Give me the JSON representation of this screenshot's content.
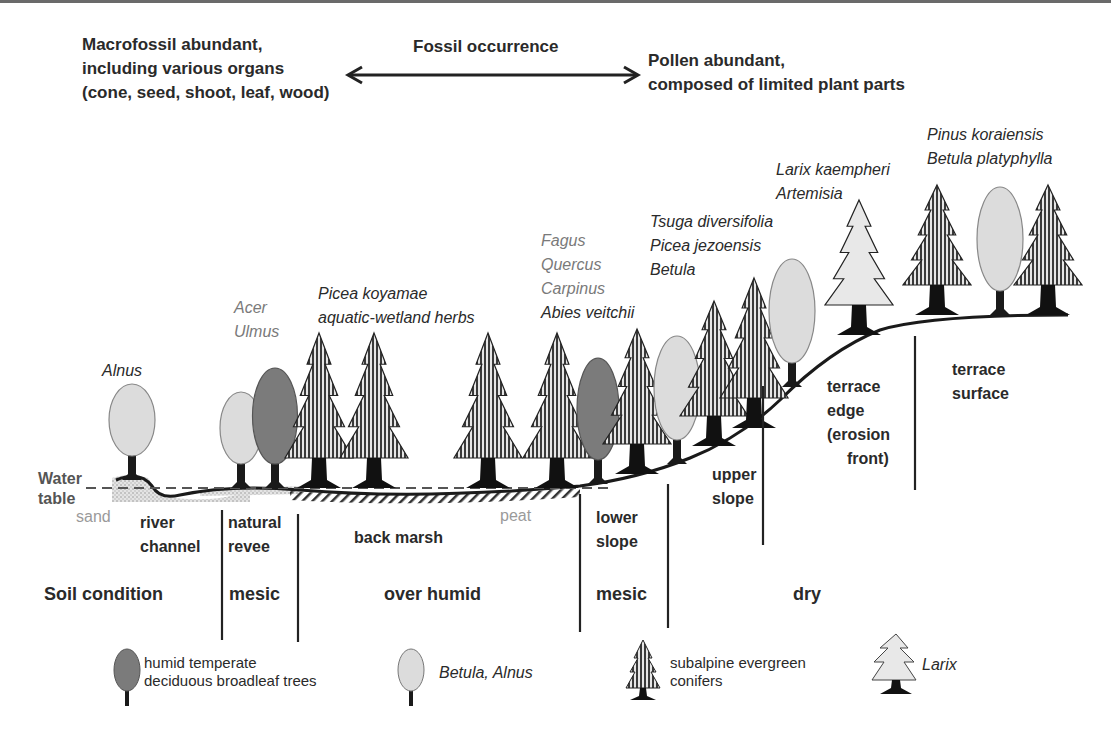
{
  "colors": {
    "text": "#2a2a2a",
    "grey_text": "#7a7a7a",
    "light_grey_text": "#9a9a9a",
    "deciduous_fill": "#7b7b7b",
    "betula_fill": "#dcdcdc",
    "larix_fill": "#e8e8e8",
    "conifer_stripe": "#3a3a3a",
    "ground": "#1a1a1a"
  },
  "header": {
    "left_lines": [
      "Macrofossil abundant,",
      "including various organs",
      "(cone, seed, shoot, leaf, wood)"
    ],
    "center": "Fossil occurrence",
    "right_lines": [
      "Pollen abundant,",
      "composed of limited plant parts"
    ]
  },
  "taxa_labels": [
    {
      "lines": [
        "Alnus"
      ],
      "x": 102,
      "y": 376,
      "style": "ital"
    },
    {
      "lines": [
        "Acer",
        "Ulmus"
      ],
      "x": 234,
      "y": 313,
      "style": "ital-grey"
    },
    {
      "lines": [
        "Picea koyamae",
        "aquatic-wetland herbs"
      ],
      "x": 318,
      "y": 299,
      "style": "ital"
    },
    {
      "lines": [
        "Fagus",
        "Quercus",
        "Carpinus"
      ],
      "x": 541,
      "y": 246,
      "style": "ital-grey"
    },
    {
      "lines": [
        "Abies veitchii"
      ],
      "x": 541,
      "y": 318,
      "style": "ital"
    },
    {
      "lines": [
        "Tsuga diversifolia",
        "Picea jezoensis",
        "Betula"
      ],
      "x": 650,
      "y": 227,
      "style": "ital"
    },
    {
      "lines": [
        "Larix kaempheri",
        "Artemisia"
      ],
      "x": 776,
      "y": 175,
      "style": "ital"
    },
    {
      "lines": [
        "Pinus koraiensis",
        "Betula platyphylla"
      ],
      "x": 927,
      "y": 140,
      "style": "ital"
    }
  ],
  "annotations": {
    "water_table": [
      "Water",
      "table"
    ],
    "sand": "sand",
    "peat": "peat"
  },
  "landforms": [
    {
      "lines": [
        "river",
        "channel"
      ],
      "x": 140,
      "y": 528
    },
    {
      "lines": [
        "natural",
        "revee"
      ],
      "x": 228,
      "y": 528
    },
    {
      "lines": [
        "back marsh"
      ],
      "x": 354,
      "y": 543
    },
    {
      "lines": [
        "lower",
        "slope"
      ],
      "x": 596,
      "y": 523
    },
    {
      "lines": [
        "upper",
        "slope"
      ],
      "x": 712,
      "y": 480
    },
    {
      "lines": [
        "terrace",
        "edge",
        "(erosion",
        "front)"
      ],
      "x": 827,
      "y": 392
    },
    {
      "lines": [
        "terrace",
        "surface"
      ],
      "x": 952,
      "y": 375
    }
  ],
  "soil_condition": {
    "title": "Soil condition",
    "zones": [
      {
        "label": "mesic",
        "x": 229
      },
      {
        "label": "over humid",
        "x": 384
      },
      {
        "label": "mesic",
        "x": 596
      },
      {
        "label": "dry",
        "x": 793
      }
    ]
  },
  "dividers": [
    {
      "x": 222,
      "y1": 510,
      "y2": 640
    },
    {
      "x": 298,
      "y1": 514,
      "y2": 642
    },
    {
      "x": 580,
      "y1": 494,
      "y2": 632
    },
    {
      "x": 668,
      "y1": 484,
      "y2": 628
    },
    {
      "x": 763,
      "y1": 386,
      "y2": 545
    },
    {
      "x": 915,
      "y1": 336,
      "y2": 490
    }
  ],
  "legend": [
    {
      "icon": "deciduous-tree-icon",
      "lines": [
        "humid temperate",
        "deciduous broadleaf trees"
      ],
      "style": "reg"
    },
    {
      "icon": "betula-tree-icon",
      "lines": [
        "Betula, Alnus"
      ],
      "style": "ital"
    },
    {
      "icon": "conifer-tree-icon",
      "lines": [
        "subalpine evergreen",
        "conifers"
      ],
      "style": "reg"
    },
    {
      "icon": "larix-tree-icon",
      "lines": [
        "Larix"
      ],
      "style": "ital"
    }
  ],
  "trees": [
    {
      "type": "betula",
      "x": 132,
      "base": 480,
      "w": 46,
      "h": 72
    },
    {
      "type": "betula",
      "x": 241,
      "base": 488,
      "w": 42,
      "h": 72
    },
    {
      "type": "deciduous",
      "x": 275,
      "base": 488,
      "w": 45,
      "h": 96
    },
    {
      "type": "conifer",
      "x": 319,
      "base": 488,
      "h": 155
    },
    {
      "type": "conifer",
      "x": 374,
      "base": 488,
      "h": 155
    },
    {
      "type": "conifer",
      "x": 488,
      "base": 488,
      "h": 155
    },
    {
      "type": "conifer",
      "x": 557,
      "base": 488,
      "h": 155
    },
    {
      "type": "deciduous",
      "x": 598,
      "base": 484,
      "w": 42,
      "h": 102
    },
    {
      "type": "conifer",
      "x": 637,
      "base": 474,
      "h": 145
    },
    {
      "type": "betula",
      "x": 677,
      "base": 464,
      "w": 46,
      "h": 104
    },
    {
      "type": "conifer",
      "x": 714,
      "base": 446,
      "h": 145
    },
    {
      "type": "conifer",
      "x": 754,
      "base": 428,
      "h": 150
    },
    {
      "type": "betula",
      "x": 792,
      "base": 387,
      "w": 46,
      "h": 104
    },
    {
      "type": "larix",
      "x": 859,
      "base": 335,
      "h": 135
    },
    {
      "type": "conifer",
      "x": 937,
      "base": 315,
      "h": 130
    },
    {
      "type": "betula",
      "x": 1000,
      "base": 315,
      "w": 46,
      "h": 104
    },
    {
      "type": "conifer",
      "x": 1048,
      "base": 315,
      "h": 130
    }
  ]
}
